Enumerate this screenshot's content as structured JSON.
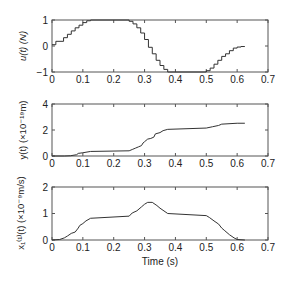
{
  "figure": {
    "xlabel": "Time (s)",
    "x_ticks": [
      "0",
      "0.1",
      "0.2",
      "0.3",
      "0.4",
      "0.5",
      "0.6",
      "0.7"
    ]
  },
  "chart_data": [
    {
      "type": "line",
      "title": "",
      "ylabel": "u(t) (N)",
      "xlabel": "",
      "xlim": [
        0,
        0.7
      ],
      "ylim": [
        -1,
        1
      ],
      "y_ticks": [
        "-1",
        "0",
        "1"
      ],
      "grid": false,
      "step": true,
      "series": [
        {
          "name": "u(t)",
          "x": [
            0,
            0.0125,
            0.0375,
            0.05,
            0.0625,
            0.075,
            0.0875,
            0.1,
            0.1125,
            0.125,
            0.25,
            0.2625,
            0.275,
            0.2875,
            0.3,
            0.3125,
            0.325,
            0.3375,
            0.35,
            0.3625,
            0.375,
            0.5,
            0.5125,
            0.525,
            0.5375,
            0.55,
            0.5625,
            0.575,
            0.5875,
            0.6,
            0.6125,
            0.625
          ],
          "y": [
            0.05,
            0.18,
            0.32,
            0.45,
            0.58,
            0.7,
            0.8,
            0.9,
            0.97,
            1.0,
            0.95,
            0.85,
            0.7,
            0.5,
            0.25,
            -0.05,
            -0.3,
            -0.55,
            -0.75,
            -0.9,
            -1.0,
            -0.95,
            -0.85,
            -0.7,
            -0.55,
            -0.4,
            -0.3,
            -0.18,
            -0.08,
            -0.04,
            -0.02,
            -0.02
          ]
        }
      ]
    },
    {
      "type": "line",
      "title": "",
      "ylabel": "y(t) (×10⁻¹⁹m)",
      "xlabel": "",
      "xlim": [
        0,
        0.7
      ],
      "ylim": [
        0,
        4
      ],
      "y_ticks": [
        "0",
        "2",
        "4"
      ],
      "grid": false,
      "step": false,
      "series": [
        {
          "name": "y(t)",
          "x": [
            0,
            0.04,
            0.06,
            0.08,
            0.085,
            0.1,
            0.125,
            0.25,
            0.26,
            0.27,
            0.28,
            0.29,
            0.295,
            0.3,
            0.31,
            0.32,
            0.33,
            0.335,
            0.35,
            0.36,
            0.375,
            0.5,
            0.52,
            0.54,
            0.55,
            0.6,
            0.625
          ],
          "y": [
            0,
            0,
            0.02,
            0.1,
            0.2,
            0.25,
            0.35,
            0.4,
            0.5,
            0.6,
            0.7,
            0.8,
            1.0,
            1.1,
            1.3,
            1.35,
            1.45,
            1.7,
            1.8,
            1.95,
            2.05,
            2.15,
            2.25,
            2.35,
            2.45,
            2.52,
            2.52
          ]
        }
      ]
    },
    {
      "type": "line",
      "title": "",
      "ylabel": "x₁⁽¹⁾(t) (×10⁻⁹m/s)",
      "xlabel": "Time (s)",
      "xlim": [
        0,
        0.7
      ],
      "ylim": [
        0,
        2
      ],
      "y_ticks": [
        "0",
        "1",
        "2"
      ],
      "grid": false,
      "step": false,
      "series": [
        {
          "name": "x1(1)(t)",
          "x": [
            0,
            0.025,
            0.04,
            0.05,
            0.0625,
            0.075,
            0.085,
            0.09,
            0.1,
            0.11,
            0.125,
            0.25,
            0.26,
            0.275,
            0.29,
            0.3,
            0.31,
            0.325,
            0.34,
            0.35,
            0.375,
            0.5,
            0.51,
            0.525,
            0.54,
            0.55,
            0.56,
            0.575,
            0.59,
            0.6,
            0.625
          ],
          "y": [
            0,
            0.02,
            0.08,
            0.15,
            0.25,
            0.3,
            0.45,
            0.55,
            0.62,
            0.72,
            0.82,
            0.9,
            1.02,
            1.1,
            1.25,
            1.35,
            1.42,
            1.42,
            1.3,
            1.2,
            1.0,
            0.92,
            0.85,
            0.72,
            0.6,
            0.45,
            0.35,
            0.2,
            0.08,
            0.02,
            0
          ]
        }
      ]
    }
  ]
}
